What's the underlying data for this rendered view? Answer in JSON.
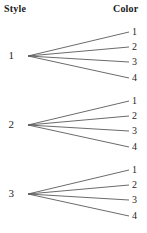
{
  "headers": {
    "left": "Style",
    "right": "Color"
  },
  "colors": {
    "background": "#ffffff",
    "line": "#5a5a5a",
    "header_text": "#1b1b1b",
    "label_text": "#262626"
  },
  "chart_data": {
    "type": "diagram",
    "title": "",
    "xlabel": "Style",
    "ylabel": "Color",
    "levels": [
      "Style",
      "Color"
    ],
    "branch_count_level1": 3,
    "branch_count_level2": 4,
    "total_outcomes": 12,
    "groups": [
      {
        "node": "1",
        "node_x": 14,
        "node_y": 56,
        "fan_x": 28,
        "leaves": [
          {
            "label": "1",
            "x": 132,
            "y": 32,
            "line_end_x": 129,
            "line_end_y": 32
          },
          {
            "label": "2",
            "x": 132,
            "y": 47,
            "line_end_x": 129,
            "line_end_y": 47
          },
          {
            "label": "3",
            "x": 132,
            "y": 62,
            "line_end_x": 129,
            "line_end_y": 62
          },
          {
            "label": "4",
            "x": 132,
            "y": 78,
            "line_end_x": 129,
            "line_end_y": 78
          }
        ]
      },
      {
        "node": "2",
        "node_x": 14,
        "node_y": 125,
        "fan_x": 28,
        "leaves": [
          {
            "label": "1",
            "x": 132,
            "y": 101,
            "line_end_x": 129,
            "line_end_y": 101
          },
          {
            "label": "2",
            "x": 132,
            "y": 116,
            "line_end_x": 129,
            "line_end_y": 116
          },
          {
            "label": "3",
            "x": 132,
            "y": 131,
            "line_end_x": 129,
            "line_end_y": 131
          },
          {
            "label": "4",
            "x": 132,
            "y": 147,
            "line_end_x": 129,
            "line_end_y": 147
          }
        ]
      },
      {
        "node": "3",
        "node_x": 14,
        "node_y": 194,
        "fan_x": 28,
        "leaves": [
          {
            "label": "1",
            "x": 132,
            "y": 170,
            "line_end_x": 129,
            "line_end_y": 170
          },
          {
            "label": "2",
            "x": 132,
            "y": 185,
            "line_end_x": 129,
            "line_end_y": 185
          },
          {
            "label": "3",
            "x": 132,
            "y": 200,
            "line_end_x": 129,
            "line_end_y": 200
          },
          {
            "label": "4",
            "x": 132,
            "y": 216,
            "line_end_x": 129,
            "line_end_y": 216
          }
        ]
      }
    ]
  }
}
